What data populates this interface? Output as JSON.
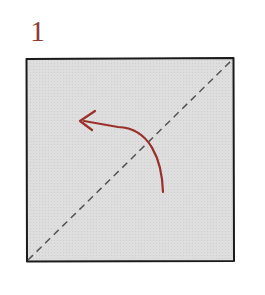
{
  "step": {
    "number": "1"
  },
  "diagram": {
    "paper_fill": "#dcdcdc",
    "outline_color": "#1a1a1a",
    "fold_line_color": "#555555",
    "arrow_color": "#9b2f2a",
    "elements": [
      "paper-square",
      "diagonal-valley-fold-line",
      "curved-fold-arrow"
    ]
  }
}
